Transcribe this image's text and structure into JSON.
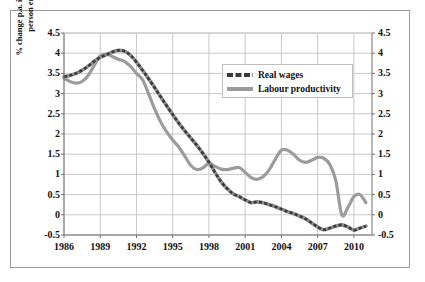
{
  "chart_data": {
    "type": "line",
    "title": "",
    "xlabel": "",
    "ylabel": "% change p.a. in real wages and output per person employed over 5 years.",
    "xlim": [
      1986,
      2011.5
    ],
    "ylim": [
      -0.5,
      4.5
    ],
    "grid": true,
    "legend_position": "top-right-inside",
    "x_tick_labels": [
      "1986",
      "1989",
      "1992",
      "1995",
      "1998",
      "2001",
      "2004",
      "2007",
      "2010"
    ],
    "x_tick_values": [
      1986,
      1989,
      1992,
      1995,
      1998,
      2001,
      2004,
      2007,
      2010
    ],
    "y_tick_labels": [
      "4.5",
      "4",
      "3.5",
      "3",
      "2.5",
      "2",
      "1.5",
      "1",
      "0.5",
      "0",
      "-0.5"
    ],
    "y_tick_values": [
      4.5,
      4,
      3.5,
      3,
      2.5,
      2,
      1.5,
      1,
      0.5,
      0,
      -0.5
    ],
    "y_tick_labels_right": [
      "4.5",
      "4",
      "3.5",
      "3",
      "2.5",
      "2",
      "1.5",
      "1",
      "0.5",
      "0",
      "-0.5"
    ],
    "x": [
      1986,
      1986.5,
      1987,
      1987.5,
      1988,
      1988.5,
      1989,
      1989.5,
      1990,
      1990.5,
      1991,
      1991.5,
      1992,
      1992.5,
      1993,
      1993.5,
      1994,
      1994.5,
      1995,
      1995.5,
      1996,
      1996.5,
      1997,
      1997.5,
      1998,
      1998.5,
      1999,
      1999.5,
      2000,
      2000.5,
      2001,
      2001.5,
      2002,
      2002.5,
      2003,
      2003.5,
      2004,
      2004.5,
      2005,
      2005.5,
      2006,
      2006.5,
      2007,
      2007.5,
      2008,
      2008.5,
      2009,
      2009.5,
      2010,
      2010.5,
      2011
    ],
    "series": [
      {
        "name": "Real wages",
        "color": "#3a3a3a",
        "style": "dashed",
        "values": [
          3.42,
          3.45,
          3.5,
          3.58,
          3.68,
          3.8,
          3.9,
          3.96,
          4.03,
          4.07,
          4.05,
          3.95,
          3.78,
          3.58,
          3.37,
          3.15,
          2.92,
          2.7,
          2.48,
          2.27,
          2.08,
          1.9,
          1.72,
          1.52,
          1.3,
          1.05,
          0.82,
          0.65,
          0.52,
          0.45,
          0.37,
          0.3,
          0.32,
          0.3,
          0.25,
          0.2,
          0.14,
          0.08,
          0.03,
          -0.03,
          -0.1,
          -0.2,
          -0.3,
          -0.37,
          -0.33,
          -0.28,
          -0.25,
          -0.3,
          -0.38,
          -0.33,
          -0.28
        ]
      },
      {
        "name": "Labour productivity",
        "color": "#9b9b9b",
        "style": "solid",
        "values": [
          3.38,
          3.3,
          3.26,
          3.3,
          3.45,
          3.7,
          3.93,
          3.98,
          3.92,
          3.85,
          3.8,
          3.68,
          3.5,
          3.35,
          3.0,
          2.62,
          2.3,
          2.05,
          1.85,
          1.68,
          1.45,
          1.22,
          1.12,
          1.16,
          1.28,
          1.2,
          1.13,
          1.12,
          1.15,
          1.17,
          1.05,
          0.92,
          0.88,
          0.95,
          1.12,
          1.38,
          1.6,
          1.6,
          1.5,
          1.35,
          1.3,
          1.35,
          1.42,
          1.4,
          1.25,
          0.85,
          0.0,
          0.18,
          0.45,
          0.5,
          0.3
        ]
      }
    ]
  },
  "legend": {
    "items": [
      {
        "label": "Real wages",
        "color": "#3a3a3a",
        "style": "dashed"
      },
      {
        "label": "Labour productivity",
        "color": "#9b9b9b",
        "style": "solid"
      }
    ]
  },
  "axis": {
    "ylabel_text": "% change p.a. in real wages and output per person employed over 5 years."
  },
  "colors": {
    "real_wages": "#3a3a3a",
    "labour_productivity": "#9b9b9b",
    "grid": "#c8c8c8",
    "frame": "#9a9a9a",
    "text": "#111111",
    "background": "#ffffff"
  }
}
